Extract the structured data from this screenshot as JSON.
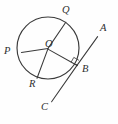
{
  "figure": {
    "background_color": "#fefefe",
    "stroke_color": "#3a3a3a",
    "label_color": "#2e2e2e"
  },
  "circle": {
    "name": "circle-O",
    "center_x": 48,
    "center_y": 48,
    "radius": 31
  },
  "points": [
    {
      "id": "Q",
      "label": "Q",
      "x": 65.5,
      "y": 22.5,
      "label_x": 62,
      "label_y": 7,
      "on": "circle"
    },
    {
      "id": "P",
      "label": "P",
      "x": 22.0,
      "y": 52.0,
      "label_x": 4,
      "label_y": 46,
      "on": "circle"
    },
    {
      "id": "O",
      "label": "O",
      "x": 48.0,
      "y": 48.0,
      "label_x": 45,
      "label_y": 40,
      "on": "center"
    },
    {
      "id": "R",
      "label": "R",
      "x": 37.0,
      "y": 78.0,
      "label_x": 30,
      "label_y": 80,
      "on": "circle"
    },
    {
      "id": "B",
      "label": "B",
      "x": 77.0,
      "y": 65.0,
      "label_x": 81,
      "label_y": 64,
      "on": "circle"
    },
    {
      "id": "A",
      "label": "A",
      "x": 97.5,
      "y": 37.0,
      "label_x": 99,
      "label_y": 24,
      "on": "tangent-end"
    },
    {
      "id": "C",
      "label": "C",
      "x": 51.5,
      "y": 102.0,
      "label_x": 41,
      "label_y": 103,
      "on": "tangent-end"
    }
  ],
  "segments": [
    {
      "id": "QR",
      "name": "chord-q-r",
      "from": "Q",
      "to": "R",
      "description": "chord through center from Q to R"
    },
    {
      "id": "PO",
      "name": "radius-p-o",
      "from": "P",
      "to": "O",
      "description": "radius from P to center O"
    },
    {
      "id": "OB",
      "name": "radius-o-b",
      "from": "O",
      "to": "B",
      "description": "radius from center O to tangent point B"
    },
    {
      "id": "AC",
      "name": "tangent-line-a-c",
      "from": "A",
      "to": "C",
      "description": "tangent line touching circle at B"
    }
  ],
  "marks": [
    {
      "id": "right-angle-B",
      "name": "right-angle-mark",
      "at": "B",
      "description": "right angle between radius OB and tangent AC"
    }
  ],
  "labels": {
    "Q": "Q",
    "P": "P",
    "O": "O",
    "R": "R",
    "B": "B",
    "A": "A",
    "C": "C"
  }
}
